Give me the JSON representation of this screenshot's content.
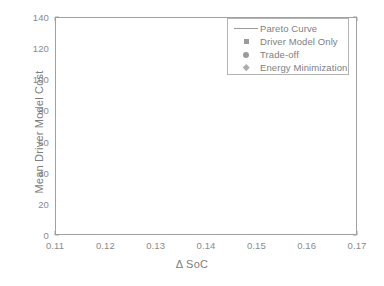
{
  "chart_data": {
    "type": "line",
    "title": "",
    "xlabel": "Δ SoC",
    "ylabel": "Mean Driver Model Cost",
    "xlim": [
      0.11,
      0.17
    ],
    "ylim": [
      0,
      140
    ],
    "xticks": [
      "0.11",
      "0.12",
      "0.13",
      "0.14",
      "0.15",
      "0.16",
      "0.17"
    ],
    "xtick_values": [
      0.11,
      0.12,
      0.13,
      0.14,
      0.15,
      0.16,
      0.17
    ],
    "yticks": [
      "0",
      "20",
      "40",
      "60",
      "80",
      "100",
      "120",
      "140"
    ],
    "ytick_values": [
      0,
      20,
      40,
      60,
      80,
      100,
      120,
      140
    ],
    "grid": false,
    "legend_position": "top-right",
    "series": [
      {
        "name": "Pareto Curve",
        "marker": "line",
        "color": "#9a9a9a",
        "x": [
          0.1128,
          0.1145,
          0.1165,
          0.1185,
          0.1205,
          0.1225,
          0.1245,
          0.1265,
          0.1285,
          0.1305,
          0.1325,
          0.1345,
          0.1365,
          0.1385,
          0.1405,
          0.1425,
          0.145,
          0.1475,
          0.15,
          0.1525,
          0.155,
          0.1575,
          0.16,
          0.1622
        ],
        "y": [
          133.5,
          119.0,
          104.5,
          92.0,
          81.0,
          71.5,
          63.0,
          55.5,
          48.8,
          42.8,
          37.6,
          33.0,
          28.9,
          25.4,
          22.4,
          17.0,
          15.6,
          14.3,
          13.3,
          12.4,
          11.8,
          11.2,
          10.8,
          10.5
        ]
      },
      {
        "name": "Driver Model Only",
        "marker": "square",
        "color": "#9b9b9b",
        "x": [
          0.1622
        ],
        "y": [
          10.5
        ]
      },
      {
        "name": "Trade-off",
        "marker": "circle",
        "color": "#9b9b9b",
        "x": [
          0.1425
        ],
        "y": [
          17.0
        ]
      },
      {
        "name": "Energy Minimization",
        "marker": "diamond",
        "color": "#adadad",
        "x": [
          0.1128
        ],
        "y": [
          133.5
        ]
      }
    ]
  },
  "legend": {
    "items": [
      {
        "label": "Pareto Curve",
        "symbol": "line"
      },
      {
        "label": "Driver Model Only",
        "symbol": "square"
      },
      {
        "label": "Trade-off",
        "symbol": "circle"
      },
      {
        "label": "Energy Minimization",
        "symbol": "diamond"
      }
    ]
  },
  "axes": {
    "xlabel": "Δ SoC",
    "ylabel": "Mean Driver Model Cost"
  },
  "colors": {
    "curve": "#9a9a9a",
    "marker": "#9b9b9b",
    "axis": "#a0a0a0",
    "text": "#808080"
  }
}
